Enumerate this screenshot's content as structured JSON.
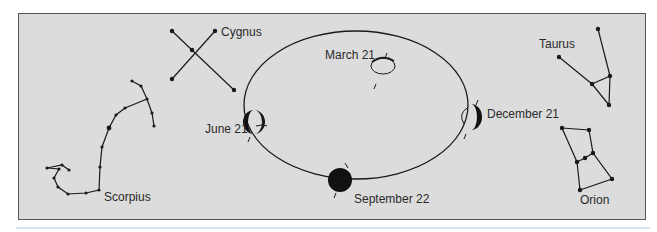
{
  "figure": {
    "colors": {
      "panel_bg": "#dcdcdc",
      "panel_border": "#555555",
      "ink": "#1a1a1a",
      "rule": "#cfe6ee"
    },
    "constellations": [
      {
        "name": "Cygnus"
      },
      {
        "name": "Scorpius"
      },
      {
        "name": "Taurus"
      },
      {
        "name": "Orion"
      }
    ],
    "orbit_positions": [
      {
        "label": "March 21"
      },
      {
        "label": "June 21"
      },
      {
        "label": "September 22"
      },
      {
        "label": "December 21"
      }
    ]
  }
}
